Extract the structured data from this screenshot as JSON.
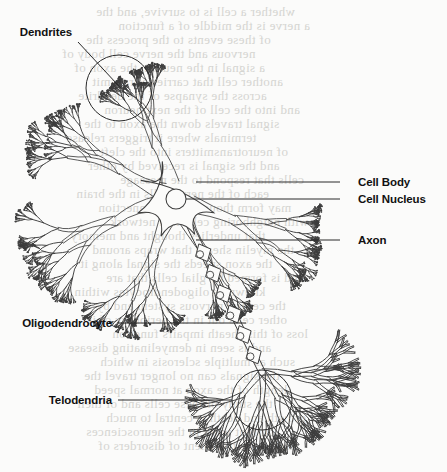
{
  "figure": {
    "kind": "neuron-anatomy-diagram",
    "background_color": "#fbfbfa",
    "ink_color": "#3d3d3d",
    "label_color": "#111111",
    "bleed_color": "#cfcfcb"
  },
  "labels": [
    {
      "id": "dendrites",
      "text": "Dendrites",
      "side": "left",
      "text_x": 28,
      "text_y": 26,
      "leader": {
        "type": "diagonal",
        "x1": 78,
        "y1": 42,
        "x2": 129,
        "y2": 97
      },
      "callout_circle": {
        "cx": 119,
        "cy": 88,
        "r": 33
      }
    },
    {
      "id": "cell-body",
      "text": "Cell Body",
      "side": "right",
      "text_x": 358,
      "text_y": 176,
      "leader": {
        "type": "horizontal",
        "x1": 340,
        "y1": 182,
        "x2": 196,
        "y2": 182
      }
    },
    {
      "id": "cell-nucleus",
      "text": "Cell Nucleus",
      "side": "right",
      "text_x": 358,
      "text_y": 193,
      "leader": {
        "type": "horizontal",
        "x1": 340,
        "y1": 199,
        "x2": 186,
        "y2": 199
      }
    },
    {
      "id": "axon",
      "text": "Axon",
      "side": "right",
      "text_x": 358,
      "text_y": 234,
      "leader": {
        "type": "horizontal",
        "x1": 340,
        "y1": 240,
        "x2": 196,
        "y2": 240
      }
    },
    {
      "id": "oligodendrocyte",
      "text": "Oligodendrocyte",
      "side": "left",
      "text_x": 22,
      "text_y": 317,
      "leader": {
        "type": "horizontal",
        "x1": 118,
        "y1": 323,
        "x2": 246,
        "y2": 323
      }
    },
    {
      "id": "telodendria",
      "text": "Telodendria",
      "side": "left",
      "text_x": 48,
      "text_y": 394,
      "leader": {
        "type": "horizontal",
        "x1": 118,
        "y1": 400,
        "x2": 232,
        "y2": 400
      },
      "callout_circle": {
        "cx": 262,
        "cy": 400,
        "r": 30
      }
    }
  ],
  "soma": {
    "center_x": 176,
    "center_y": 199,
    "nucleus_r": 10,
    "arm_count": 6,
    "arm_half_width": 9
  },
  "dendrite_trunks": [
    {
      "angle_deg": 208,
      "length": 46,
      "depth": 7,
      "spread": 34
    },
    {
      "angle_deg": 250,
      "length": 40,
      "depth": 7,
      "spread": 32
    },
    {
      "angle_deg": 160,
      "length": 48,
      "depth": 7,
      "spread": 33
    },
    {
      "angle_deg": 112,
      "length": 44,
      "depth": 7,
      "spread": 31
    },
    {
      "angle_deg": 62,
      "length": 42,
      "depth": 7,
      "spread": 33
    },
    {
      "angle_deg": 20,
      "length": 46,
      "depth": 7,
      "spread": 31
    }
  ],
  "axon": {
    "start_x": 190,
    "start_y": 226,
    "end_x": 262,
    "end_y": 372,
    "half_width": 3.2,
    "myelin_segments": 6,
    "myelin_half_width": 8.5,
    "myelin_nucleus_r": 3.6
  },
  "telodendria": {
    "origin_x": 262,
    "origin_y": 372,
    "branch_count": 5,
    "depth": 4,
    "length": 30,
    "spread": 46
  },
  "bleed_text": {
    "note": "illegible show-through text from the reverse side of the printed page",
    "lines": [
      {
        "x": 96,
        "y": 4,
        "text": "whether a cell is to survive, and the"
      },
      {
        "x": 118,
        "y": 18,
        "text": "a nerve is the middle of a function"
      },
      {
        "x": 86,
        "y": 32,
        "text": "of these events to the process the"
      },
      {
        "x": 62,
        "y": 46,
        "text": "nervous and the nerve cell body of"
      },
      {
        "x": 74,
        "y": 60,
        "text": "a signal in the neuron, the axon of"
      },
      {
        "x": 92,
        "y": 74,
        "text": "another cell that carries a transmit"
      },
      {
        "x": 78,
        "y": 88,
        "text": "across the synapse of the dendrite"
      },
      {
        "x": 104,
        "y": 102,
        "text": "and into the cell of the next neuron"
      },
      {
        "x": 84,
        "y": 116,
        "text": "signal travels down the axon to the"
      },
      {
        "x": 66,
        "y": 130,
        "text": "terminals where it triggers release"
      },
      {
        "x": 100,
        "y": 144,
        "text": "of neurotransmitters into the cleft"
      },
      {
        "x": 88,
        "y": 158,
        "text": "and the signal is received by other"
      },
      {
        "x": 120,
        "y": 172,
        "text": "cells that respond to the message"
      },
      {
        "x": 76,
        "y": 186,
        "text": "each of the nerve cells in the brain"
      },
      {
        "x": 98,
        "y": 200,
        "text": "may form thousands of connection"
      },
      {
        "x": 110,
        "y": 214,
        "text": "with neighboring cells in a network"
      },
      {
        "x": 70,
        "y": 228,
        "text": "that underlies thought and memory"
      },
      {
        "x": 92,
        "y": 242,
        "text": "the myelin sheath that wraps around"
      },
      {
        "x": 80,
        "y": 256,
        "text": "the axon speeds the signal along it"
      },
      {
        "x": 106,
        "y": 270,
        "text": "and is formed by glial cells that are"
      },
      {
        "x": 74,
        "y": 284,
        "text": "known as oligodendrocytes within"
      },
      {
        "x": 96,
        "y": 298,
        "text": "the central nervous system and by"
      },
      {
        "x": 88,
        "y": 312,
        "text": "other cells out in the periphery of it"
      },
      {
        "x": 112,
        "y": 326,
        "text": "loss of this sheath impairs function"
      },
      {
        "x": 68,
        "y": 340,
        "text": "and is seen in demyelinating disease"
      },
      {
        "x": 100,
        "y": 354,
        "text": "such as multiple sclerosis in which"
      },
      {
        "x": 84,
        "y": 368,
        "text": "the signals can no longer travel the"
      },
      {
        "x": 94,
        "y": 382,
        "text": "length of the axon at normal speed"
      },
      {
        "x": 76,
        "y": 396,
        "text": "the study of these cells and of their"
      },
      {
        "x": 106,
        "y": 410,
        "text": "growth and death is central to much"
      },
      {
        "x": 86,
        "y": 424,
        "text": "current work in the neurosciences"
      },
      {
        "x": 98,
        "y": 438,
        "text": "and in the treatment of disorders of"
      }
    ]
  }
}
